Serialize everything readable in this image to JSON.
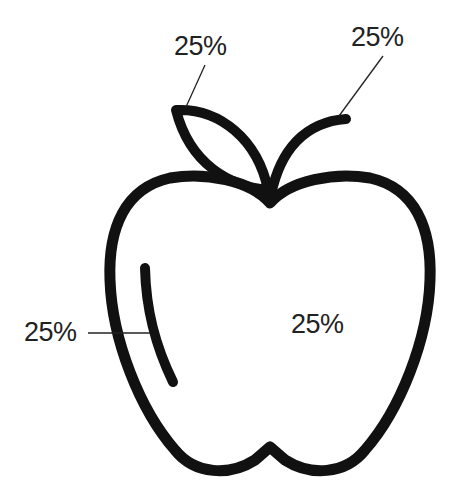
{
  "diagram": {
    "stroke_color": "#111111",
    "text_color": "#222222",
    "background": "#ffffff",
    "labels": [
      {
        "id": "leaf",
        "text": "25%",
        "points_to": "leaf"
      },
      {
        "id": "stem",
        "text": "25%",
        "points_to": "stem"
      },
      {
        "id": "highlight",
        "text": "25%",
        "points_to": "highlight"
      },
      {
        "id": "body",
        "text": "25%",
        "points_to": "body"
      }
    ]
  }
}
